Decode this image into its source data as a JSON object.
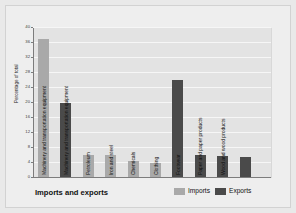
{
  "chart_data": {
    "type": "bar",
    "title": "",
    "xlabel": "Imports and exports",
    "ylabel": "Percentage of total",
    "ylim": [
      0,
      40
    ],
    "yticks": [
      0,
      4,
      8,
      12,
      16,
      20,
      24,
      28,
      32,
      36,
      40
    ],
    "grid": true,
    "legend_position": "bottom-right",
    "categories": [
      "Machinery and transportation equipment",
      "Petroleum",
      "Iron and steel",
      "Chemicals",
      "Clothing",
      "Footwear",
      "Paper and paper products",
      "Wood and wood products"
    ],
    "series": [
      {
        "name": "Imports",
        "color": "#a9a9a9",
        "values": [
          37,
          6,
          6,
          4.2,
          3.8,
          null,
          null,
          null
        ]
      },
      {
        "name": "Exports",
        "color": "#4a4a4a",
        "values": [
          20,
          null,
          null,
          null,
          26,
          6,
          5.7,
          5.5
        ]
      }
    ],
    "bars": [
      {
        "label": "Machinery and transportation equipment",
        "series": "Imports",
        "value": 37,
        "color": "#a9a9a9"
      },
      {
        "label": "Machinery and transportation equipment",
        "series": "Exports",
        "value": 20,
        "color": "#4a4a4a"
      },
      {
        "label": "Petroleum",
        "series": "Imports",
        "value": 6,
        "color": "#a9a9a9"
      },
      {
        "label": "Iron and steel",
        "series": "Imports",
        "value": 6,
        "color": "#a9a9a9"
      },
      {
        "label": "Chemicals",
        "series": "Imports",
        "value": 4.2,
        "color": "#a9a9a9"
      },
      {
        "label": "Clothing",
        "series": "Imports",
        "value": 3.8,
        "color": "#a9a9a9"
      },
      {
        "label": "Footwear",
        "series": "Exports",
        "value": 26,
        "color": "#4a4a4a"
      },
      {
        "label": "Paper and paper products",
        "series": "Exports",
        "value": 6,
        "color": "#4a4a4a"
      },
      {
        "label": "Wood and wood products",
        "series": "Exports",
        "value": 5.7,
        "color": "#4a4a4a"
      },
      {
        "label": "",
        "series": "Exports",
        "value": 5.5,
        "color": "#4a4a4a"
      }
    ]
  },
  "legend": {
    "items": [
      {
        "label": "Imports",
        "color": "#a9a9a9"
      },
      {
        "label": "Exports",
        "color": "#4a4a4a"
      }
    ]
  },
  "labels": {
    "xlabel": "Imports and exports",
    "ylabel": "Percentage of total"
  },
  "colors": {
    "imports": "#a9a9a9",
    "exports": "#4a4a4a",
    "plot_background": "#e3e3e3",
    "figure_background": "#eeeeee",
    "gridline": "#f6f6f6",
    "axis": "#7c7c7c"
  }
}
